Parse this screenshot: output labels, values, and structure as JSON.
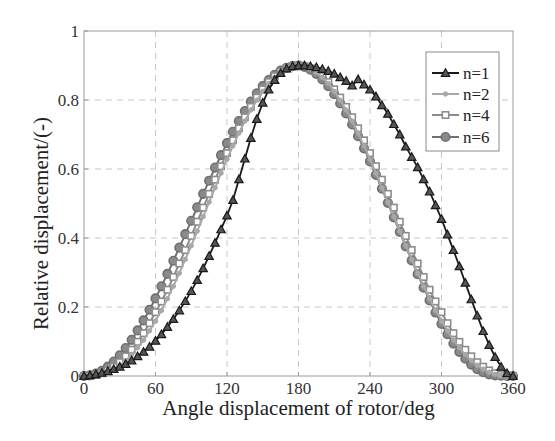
{
  "chart_data": {
    "type": "line",
    "title": "",
    "xlabel": "Angle displacement of rotor/deg",
    "ylabel": "Relative displacement/(-)",
    "xlim": [
      0,
      360
    ],
    "ylim": [
      0,
      1
    ],
    "xticks": [
      0,
      60,
      120,
      180,
      240,
      300,
      360
    ],
    "yticks": [
      0,
      0.2,
      0.4,
      0.6,
      0.8,
      1
    ],
    "xtick_labels": [
      "0",
      "60",
      "120",
      "180",
      "240",
      "300",
      "360"
    ],
    "ytick_labels": [
      "0",
      "0.2",
      "0.4",
      "0.6",
      "0.8",
      "1"
    ],
    "grid": true,
    "legend_position": "top-right",
    "x": [
      0,
      5,
      10,
      15,
      20,
      25,
      30,
      35,
      40,
      45,
      50,
      55,
      60,
      65,
      70,
      75,
      80,
      85,
      90,
      95,
      100,
      105,
      110,
      115,
      120,
      125,
      130,
      135,
      140,
      145,
      150,
      155,
      160,
      165,
      170,
      175,
      180,
      185,
      190,
      195,
      200,
      205,
      210,
      215,
      220,
      225,
      230,
      235,
      240,
      245,
      250,
      255,
      260,
      265,
      270,
      275,
      280,
      285,
      290,
      295,
      300,
      305,
      310,
      315,
      320,
      325,
      330,
      335,
      340,
      345,
      350,
      355,
      360
    ],
    "series": [
      {
        "name": "n=1",
        "color": "#1a1a1a",
        "marker": "triangle",
        "values": [
          0,
          0.002,
          0.005,
          0.009,
          0.014,
          0.02,
          0.027,
          0.035,
          0.045,
          0.057,
          0.07,
          0.085,
          0.102,
          0.121,
          0.142,
          0.165,
          0.19,
          0.217,
          0.246,
          0.278,
          0.312,
          0.348,
          0.386,
          0.425,
          0.465,
          0.51,
          0.57,
          0.63,
          0.69,
          0.745,
          0.792,
          0.83,
          0.858,
          0.878,
          0.891,
          0.898,
          0.9,
          0.9,
          0.898,
          0.895,
          0.89,
          0.884,
          0.876,
          0.866,
          0.855,
          0.842,
          0.86,
          0.845,
          0.83,
          0.81,
          0.785,
          0.76,
          0.73,
          0.7,
          0.665,
          0.635,
          0.605,
          0.57,
          0.535,
          0.495,
          0.455,
          0.41,
          0.365,
          0.318,
          0.27,
          0.222,
          0.175,
          0.13,
          0.09,
          0.055,
          0.027,
          0.008,
          0
        ]
      },
      {
        "name": "n=2",
        "color": "#a8a8a8",
        "marker": "dot",
        "values": [
          0,
          0,
          0.002,
          0.005,
          0.011,
          0.02,
          0.031,
          0.045,
          0.062,
          0.082,
          0.104,
          0.131,
          0.159,
          0.19,
          0.224,
          0.26,
          0.298,
          0.338,
          0.378,
          0.42,
          0.462,
          0.504,
          0.546,
          0.588,
          0.628,
          0.667,
          0.704,
          0.739,
          0.771,
          0.799,
          0.825,
          0.848,
          0.866,
          0.881,
          0.891,
          0.898,
          0.9,
          0.898,
          0.891,
          0.881,
          0.866,
          0.848,
          0.825,
          0.799,
          0.771,
          0.739,
          0.704,
          0.667,
          0.628,
          0.588,
          0.546,
          0.504,
          0.462,
          0.42,
          0.378,
          0.338,
          0.298,
          0.26,
          0.224,
          0.19,
          0.159,
          0.131,
          0.104,
          0.082,
          0.062,
          0.045,
          0.031,
          0.02,
          0.011,
          0.005,
          0.002,
          0,
          0
        ]
      },
      {
        "name": "n=4",
        "color": "#8c8c8c",
        "marker": "square",
        "values": [
          0,
          0.001,
          0.003,
          0.008,
          0.016,
          0.027,
          0.04,
          0.057,
          0.076,
          0.099,
          0.124,
          0.153,
          0.185,
          0.216,
          0.25,
          0.287,
          0.326,
          0.365,
          0.406,
          0.447,
          0.488,
          0.528,
          0.569,
          0.608,
          0.646,
          0.683,
          0.718,
          0.75,
          0.78,
          0.807,
          0.831,
          0.852,
          0.869,
          0.882,
          0.892,
          0.898,
          0.9,
          0.898,
          0.892,
          0.882,
          0.869,
          0.852,
          0.831,
          0.807,
          0.78,
          0.75,
          0.718,
          0.683,
          0.646,
          0.608,
          0.569,
          0.528,
          0.488,
          0.447,
          0.406,
          0.365,
          0.326,
          0.287,
          0.25,
          0.216,
          0.185,
          0.153,
          0.124,
          0.099,
          0.076,
          0.057,
          0.04,
          0.027,
          0.016,
          0.008,
          0.003,
          0.001,
          0
        ]
      },
      {
        "name": "n=6",
        "color": "#707070",
        "marker": "circle",
        "values": [
          0,
          0.002,
          0.007,
          0.015,
          0.027,
          0.042,
          0.06,
          0.081,
          0.105,
          0.132,
          0.161,
          0.192,
          0.225,
          0.26,
          0.296,
          0.334,
          0.372,
          0.411,
          0.45,
          0.489,
          0.528,
          0.566,
          0.604,
          0.64,
          0.675,
          0.708,
          0.739,
          0.768,
          0.795,
          0.819,
          0.84,
          0.858,
          0.873,
          0.885,
          0.893,
          0.898,
          0.9,
          0.896,
          0.888,
          0.876,
          0.86,
          0.84,
          0.817,
          0.79,
          0.761,
          0.729,
          0.695,
          0.66,
          0.622,
          0.583,
          0.543,
          0.502,
          0.46,
          0.418,
          0.376,
          0.335,
          0.295,
          0.256,
          0.219,
          0.184,
          0.151,
          0.121,
          0.094,
          0.07,
          0.05,
          0.033,
          0.02,
          0.011,
          0.005,
          0.002,
          0.001,
          0,
          0
        ]
      }
    ]
  }
}
